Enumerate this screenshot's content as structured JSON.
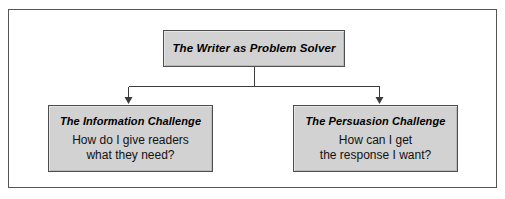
{
  "diagram": {
    "type": "hierarchy-tree",
    "orientation": "top-down",
    "colors": {
      "box_fill": "#d2d2d2",
      "box_border": "#4e4e52",
      "frame_border": "#55555a",
      "connector": "#3c3c3c",
      "text": "#000000",
      "background": "#ffffff"
    },
    "root": {
      "title": "The Writer as Problem Solver"
    },
    "children": [
      {
        "title": "The Information Challenge",
        "body": "How do I give readers\nwhat they need?"
      },
      {
        "title": "The Persuasion Challenge",
        "body": "How can I get\nthe response I want?"
      }
    ],
    "connectors": {
      "stem_label": "root-stem",
      "bus_label": "horizontal-bus",
      "arrow_left_label": "arrow-to-information-challenge",
      "arrow_right_label": "arrow-to-persuasion-challenge"
    }
  }
}
